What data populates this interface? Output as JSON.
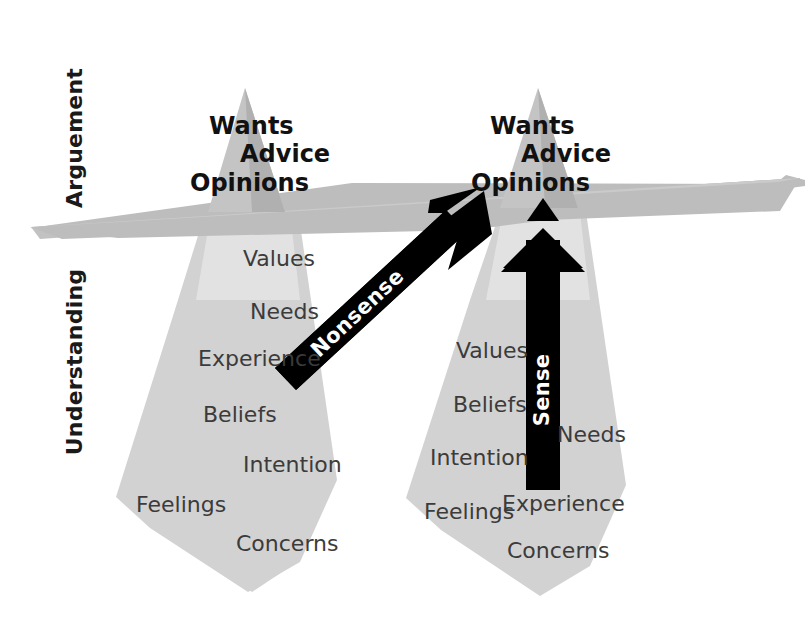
{
  "figure": {
    "background_color": "#ffffff"
  },
  "colors": {
    "iceberg_body": "#d2d2d2",
    "iceberg_tip": "#c9c9c9",
    "iceberg_tip_shade": "#b3b3b3",
    "water_plane": "#bdbdbd",
    "water_plane_light": "#cfcfcf",
    "arrow_black": "#000000",
    "text_dark": "#1a1a1a",
    "text_gray": "#3b3b3b",
    "text_white": "#ffffff"
  },
  "axis_labels": {
    "top": "Arguement",
    "bottom": "Understanding"
  },
  "icebergs": [
    {
      "id": "left",
      "tip_labels": [
        "Wants",
        "Advice",
        "Opinions"
      ],
      "deep_labels": [
        "Values",
        "Needs",
        "Experience",
        "Beliefs",
        "Intention",
        "Feelings",
        "Concerns"
      ]
    },
    {
      "id": "right",
      "tip_labels": [
        "Wants",
        "Advice",
        "Opinions"
      ],
      "deep_labels": [
        "Values",
        "Beliefs",
        "Intention",
        "Feelings",
        "Needs",
        "Experience",
        "Concerns"
      ]
    }
  ],
  "arrows": [
    {
      "id": "nonsense",
      "label": "Nonsense",
      "direction": "diagonal-up-right"
    },
    {
      "id": "sense",
      "label": "Sense",
      "direction": "vertical-up"
    }
  ],
  "left_iceberg_text_positions": [
    {
      "label": "Values",
      "x": 243,
      "y": 266
    },
    {
      "label": "Needs",
      "x": 250,
      "y": 319
    },
    {
      "label": "Experience",
      "x": 198,
      "y": 366
    },
    {
      "label": "Beliefs",
      "x": 203,
      "y": 422
    },
    {
      "label": "Intention",
      "x": 243,
      "y": 472
    },
    {
      "label": "Feelings",
      "x": 136,
      "y": 512
    },
    {
      "label": "Concerns",
      "x": 236,
      "y": 551
    }
  ],
  "right_iceberg_text_positions": [
    {
      "label": "Values",
      "x": 456,
      "y": 358
    },
    {
      "label": "Beliefs",
      "x": 453,
      "y": 412
    },
    {
      "label": "Intention",
      "x": 430,
      "y": 465
    },
    {
      "label": "Needs",
      "x": 557,
      "y": 442
    },
    {
      "label": "Feelings",
      "x": 424,
      "y": 519
    },
    {
      "label": "Experience",
      "x": 502,
      "y": 511
    },
    {
      "label": "Concerns",
      "x": 507,
      "y": 558
    }
  ],
  "left_tip_text_positions": [
    {
      "label": "Wants",
      "x": 209,
      "y": 134
    },
    {
      "label": "Advice",
      "x": 240,
      "y": 162
    },
    {
      "label": "Opinions",
      "x": 190,
      "y": 191
    }
  ],
  "right_tip_text_positions": [
    {
      "label": "Wants",
      "x": 490,
      "y": 134
    },
    {
      "label": "Advice",
      "x": 521,
      "y": 162
    },
    {
      "label": "Opinions",
      "x": 471,
      "y": 191
    }
  ]
}
